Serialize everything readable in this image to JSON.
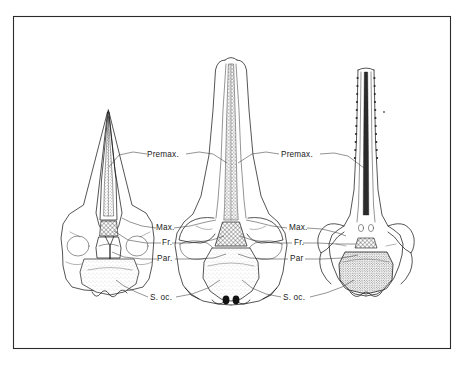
{
  "figure": {
    "type": "scientific-illustration",
    "view": "dorsal",
    "specimen_count": 3,
    "background_color": "#ffffff",
    "ink_color": "#1c1c1c",
    "frame_color": "#2b2b2b"
  },
  "labels": {
    "left_column": [
      {
        "id": "premax-left",
        "text": "Premax.",
        "x": 147,
        "y": 157
      },
      {
        "id": "max-left",
        "text": "Max.",
        "x": 156,
        "y": 230
      },
      {
        "id": "fr-left",
        "text": "Fr.",
        "x": 162,
        "y": 245
      },
      {
        "id": "par-left",
        "text": "Par.",
        "x": 157,
        "y": 261
      },
      {
        "id": "soc-left",
        "text": "S. oc.",
        "x": 148,
        "y": 300
      }
    ],
    "right_column": [
      {
        "id": "premax-right",
        "text": "Premax.",
        "x": 281,
        "y": 157
      },
      {
        "id": "max-right",
        "text": "Max.",
        "x": 289,
        "y": 230
      },
      {
        "id": "fr-right",
        "text": "Fr.",
        "x": 294,
        "y": 245
      },
      {
        "id": "par-right",
        "text": "Par",
        "x": 290,
        "y": 261
      },
      {
        "id": "soc-right",
        "text": "S. oc.",
        "x": 282,
        "y": 300
      }
    ]
  },
  "specimens": [
    {
      "id": "skull-left",
      "position": "left",
      "rostrum": "short, sharply tapering, triangular",
      "premaxilla_fill": "stippled",
      "frontal_fill": "cross-hatched",
      "occipital_fill": "stippled-light"
    },
    {
      "id": "skull-middle",
      "position": "middle",
      "rostrum": "broad, parallel-sided, bluntly rounded tip",
      "premaxilla_fill": "coarse-stippled",
      "frontal_fill": "cross-hatched",
      "occipital_fill": "stippled-light"
    },
    {
      "id": "skull-right",
      "position": "right",
      "rostrum": "very long, slender, toothed margins",
      "premaxilla_fill": "dark-line",
      "frontal_fill": "cross-hatched",
      "occipital_fill": "dense-stippled"
    }
  ],
  "terms": {
    "premax": "Premax.",
    "max": "Max.",
    "fr": "Fr.",
    "par_full": "Par.",
    "par_short": "Par",
    "soc": "S. oc."
  }
}
